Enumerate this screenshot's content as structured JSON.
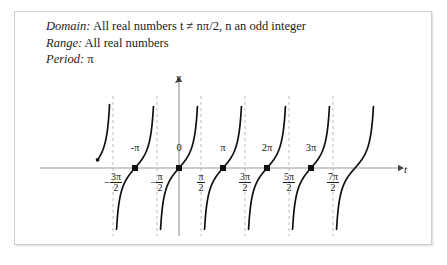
{
  "figure": {
    "properties": [
      {
        "label": "Domain:",
        "value": "All real numbers t ≠ nπ/2, n an odd integer"
      },
      {
        "label": "Range:",
        "value": "All real numbers"
      },
      {
        "label": "Period:",
        "value": "π"
      }
    ]
  },
  "chart_data": {
    "type": "line",
    "title": "",
    "subtitle": "",
    "xlabel": "t",
    "ylabel": "y",
    "function": "y = tan t",
    "grid": false,
    "legend": null,
    "xlim": [
      -4.71238898,
      11.78097245
    ],
    "ylim": [
      -4.2,
      4.2
    ],
    "axis_color": "#9a9a9a",
    "curve_color": "#111111",
    "asymptote_color": "#bdbdbd",
    "marker_color": "#111111",
    "x_tick_labels": [
      {
        "text": "-3π/2",
        "numerator": "3π",
        "denominator": "2",
        "negative": true,
        "value": -4.71238898
      },
      {
        "text": "-π/2",
        "numerator": "π",
        "denominator": "2",
        "negative": true,
        "value": -1.57079633
      },
      {
        "text": "π/2",
        "numerator": "π",
        "denominator": "2",
        "negative": false,
        "value": 1.57079633
      },
      {
        "text": "3π/2",
        "numerator": "3π",
        "denominator": "2",
        "negative": false,
        "value": 4.71238898
      },
      {
        "text": "5π/2",
        "numerator": "5π",
        "denominator": "2",
        "negative": false,
        "value": 7.85398163
      },
      {
        "text": "7π/2",
        "numerator": "7π",
        "denominator": "2",
        "negative": false,
        "value": 10.99557429
      }
    ],
    "zero_point_labels": [
      {
        "text": "-π",
        "value": -3.14159265
      },
      {
        "text": "0",
        "value": 0
      },
      {
        "text": "π",
        "value": 3.14159265
      },
      {
        "text": "2π",
        "value": 6.28318531
      },
      {
        "text": "3π",
        "value": 9.42477796
      }
    ],
    "zeros": [
      -3.14159265,
      0,
      3.14159265,
      6.28318531,
      9.42477796
    ],
    "asymptotes": [
      -4.71238898,
      -1.57079633,
      1.57079633,
      4.71238898,
      7.85398163,
      10.99557429
    ],
    "branches": [
      {
        "center": -3.14159265,
        "partial": false
      },
      {
        "center": 0,
        "partial": false
      },
      {
        "center": 3.14159265,
        "partial": false
      },
      {
        "center": 6.28318531,
        "partial": false
      },
      {
        "center": 9.42477796,
        "partial": false
      },
      {
        "center": 12.56637061,
        "partial": true
      }
    ]
  }
}
